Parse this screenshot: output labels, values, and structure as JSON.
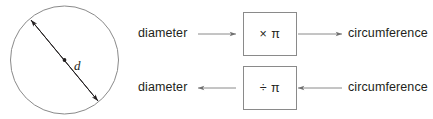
{
  "figure": {
    "stroke_color": "#8a8a8a",
    "text_color": "#231f20",
    "background": "#ffffff"
  },
  "circle_diagram": {
    "shape_name": "circle",
    "diameter_label": "d",
    "center_dot": true,
    "arrow_type": "double-headed"
  },
  "flow": {
    "rows": [
      {
        "left_label": "diameter",
        "operation": "× π",
        "right_label": "circumference",
        "direction": "right"
      },
      {
        "left_label": "diameter",
        "operation": "÷ π",
        "right_label": "circumference",
        "direction": "left"
      }
    ]
  }
}
